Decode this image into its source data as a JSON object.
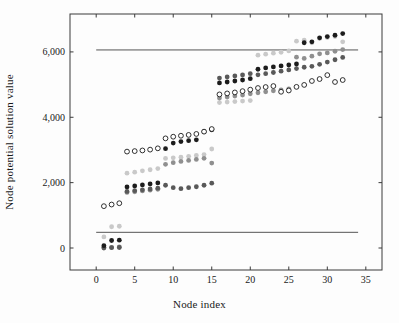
{
  "chart_data": {
    "type": "scatter",
    "title": "",
    "xlabel": "Node index",
    "ylabel": "Node potential solution value",
    "xlim": [
      -3.4,
      37.1
    ],
    "ylim": [
      -673,
      7160
    ],
    "xticks": [
      0,
      5,
      10,
      15,
      20,
      25,
      30,
      35
    ],
    "xtick_labels": [
      "0",
      "5",
      "10",
      "15",
      "20",
      "25",
      "30",
      "35"
    ],
    "yticks": [
      0,
      2000,
      4000,
      6000
    ],
    "ytick_labels": [
      "0",
      "2,000",
      "4,000",
      "6,000"
    ],
    "grid": false,
    "legend": "none",
    "frame_color": "#3a3a3a",
    "hline_color": "#555555",
    "hlines": [
      {
        "y": 6060,
        "x0": 0,
        "x1": 34
      },
      {
        "y": 480,
        "x0": 0,
        "x1": 34
      }
    ],
    "x": [
      1,
      2,
      3,
      4,
      5,
      6,
      7,
      8,
      9,
      10,
      11,
      12,
      13,
      14,
      15,
      16,
      17,
      18,
      19,
      20,
      21,
      22,
      23,
      24,
      25,
      26,
      27,
      28,
      29,
      30,
      31,
      32
    ],
    "series": [
      {
        "name": "light-gray-solution",
        "marker": "filled",
        "color": "#c9c9c9",
        "values": [
          340,
          650,
          665,
          2290,
          2320,
          2360,
          2395,
          2430,
          2740,
          2760,
          2780,
          2805,
          2830,
          2860,
          3030,
          4450,
          4465,
          4480,
          4495,
          4510,
          5900,
          5930,
          5960,
          5990,
          6030,
          6330,
          6360,
          6280,
          6410,
          6440,
          6470,
          6310
        ]
      },
      {
        "name": "medium-gray-solution",
        "marker": "filled",
        "color": "#8f8f8f",
        "values": [
          25,
          20,
          30,
          1700,
          1720,
          1745,
          1770,
          1795,
          2560,
          2610,
          2650,
          2680,
          2710,
          2745,
          2600,
          4590,
          4620,
          4650,
          4680,
          4720,
          4750,
          4780,
          4810,
          4840,
          4870,
          5840,
          5800,
          5870,
          5940,
          5970,
          6020,
          6070
        ]
      },
      {
        "name": "dark-gray-solution",
        "marker": "filled",
        "color": "#595959",
        "values": [
          0,
          10,
          15,
          1730,
          1755,
          1780,
          1805,
          1830,
          1920,
          1845,
          1815,
          1845,
          1875,
          1920,
          1985,
          5200,
          5235,
          5265,
          5295,
          5335,
          5300,
          5335,
          5370,
          5410,
          5450,
          5490,
          5530,
          5560,
          5620,
          5690,
          5760,
          5830
        ]
      },
      {
        "name": "black-solution",
        "marker": "filled",
        "color": "#1c1c1c",
        "values": [
          70,
          230,
          240,
          1870,
          1900,
          1930,
          1960,
          1990,
          3040,
          3210,
          3255,
          3285,
          3310,
          3560,
          3615,
          5050,
          5080,
          5110,
          5140,
          5180,
          5470,
          5510,
          5540,
          5570,
          5600,
          5630,
          6280,
          6310,
          6430,
          6470,
          6510,
          6560
        ]
      },
      {
        "name": "open-circle-solution",
        "marker": "open",
        "color": "#1a1a1a",
        "values": [
          1280,
          1330,
          1370,
          2950,
          2965,
          2985,
          3010,
          3050,
          3355,
          3405,
          3435,
          3460,
          3490,
          3560,
          3640,
          4700,
          4730,
          4760,
          4800,
          4845,
          4895,
          4925,
          4955,
          4780,
          4820,
          4930,
          4990,
          5110,
          5170,
          5290,
          5080,
          5140
        ]
      }
    ]
  }
}
